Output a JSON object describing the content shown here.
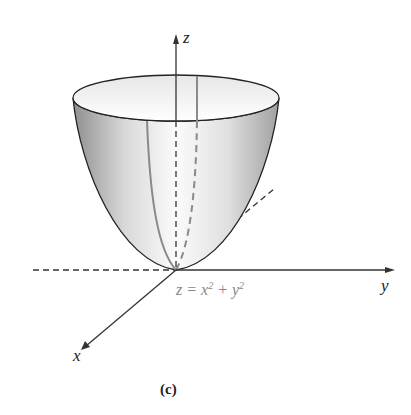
{
  "figure": {
    "caption": "(c)",
    "axes": {
      "x": "x",
      "y": "y",
      "z": "z"
    },
    "equation": {
      "lhs": "z = x",
      "exp1": "2",
      "mid": " + y",
      "exp2": "2"
    },
    "surface": "paraboloid",
    "colors": {
      "axis": "#333333",
      "surface_light": "#ffffff",
      "surface_dark": "#9a9a9a",
      "trace": "#8a8a8a",
      "equation": "#888888"
    }
  }
}
